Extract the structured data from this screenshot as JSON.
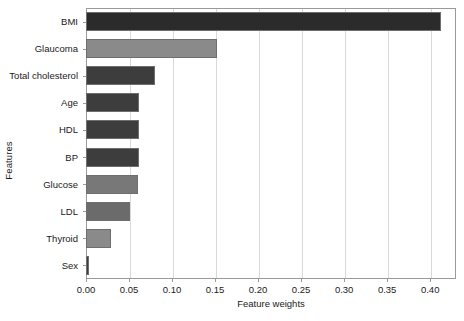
{
  "chart_data": {
    "type": "bar",
    "orientation": "horizontal",
    "title": "",
    "xlabel": "Feature weights",
    "ylabel": "Features",
    "categories": [
      "BMI",
      "Glaucoma",
      "Total cholesterol",
      "Age",
      "HDL",
      "BP",
      "Glucose",
      "LDL",
      "Thyroid",
      "Sex"
    ],
    "values": [
      0.413,
      0.152,
      0.08,
      0.062,
      0.062,
      0.062,
      0.061,
      0.051,
      0.029,
      0.004
    ],
    "bar_colors": [
      "#2b2b2b",
      "#8a8a8a",
      "#3d3d3d",
      "#3d3d3d",
      "#3d3d3d",
      "#3d3d3d",
      "#787878",
      "#6b6b6b",
      "#8a8a8a",
      "#3d3d3d"
    ],
    "xticks": [
      0.0,
      0.05,
      0.1,
      0.15,
      0.2,
      0.25,
      0.3,
      0.35,
      0.4
    ],
    "xtick_labels": [
      "0.00",
      "0.05",
      "0.10",
      "0.15",
      "0.20",
      "0.25",
      "0.30",
      "0.35",
      "0.40"
    ],
    "xlim": [
      0.0,
      0.43
    ],
    "grid": "vertical",
    "legend": null,
    "bar_edge_color": "#6e6e6e",
    "axis_color": "#9a9a9a",
    "grid_color": "#d9d9d9",
    "background": "#ffffff"
  }
}
